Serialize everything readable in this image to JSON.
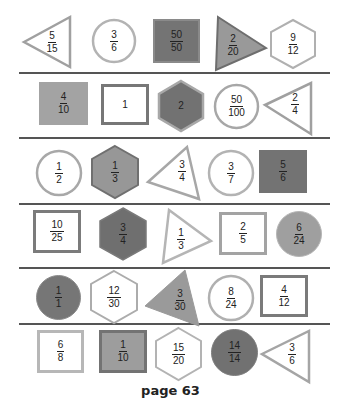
{
  "colors": {
    "outline_light": "#b0b0b0",
    "outline_mid": "#8a8a8a",
    "outline_dark": "#6e6e6e",
    "fill_light": "#a9a9a9",
    "fill_mid": "#949494",
    "fill_dark": "#747474",
    "separator": "#555555"
  },
  "rows": [
    {
      "shapes": [
        {
          "type": "triangle-left",
          "style": "outline",
          "numerator": "5",
          "denominator": "15"
        },
        {
          "type": "circle",
          "style": "outline",
          "numerator": "3",
          "denominator": "6"
        },
        {
          "type": "square",
          "style": "dark",
          "numerator": "50",
          "denominator": "50"
        },
        {
          "type": "triangle-right",
          "style": "fill",
          "numerator": "2",
          "denominator": "20"
        },
        {
          "type": "hexagon",
          "style": "outline",
          "numerator": "9",
          "denominator": "12"
        }
      ]
    },
    {
      "shapes": [
        {
          "type": "square",
          "style": "fill",
          "numerator": "4",
          "denominator": "10"
        },
        {
          "type": "square",
          "style": "outline-dark",
          "whole": "1"
        },
        {
          "type": "hexagon",
          "style": "dark",
          "whole": "2"
        },
        {
          "type": "circle",
          "style": "outline",
          "numerator": "50",
          "denominator": "100"
        },
        {
          "type": "triangle-left",
          "style": "outline",
          "numerator": "2",
          "denominator": "4"
        }
      ]
    },
    {
      "shapes": [
        {
          "type": "circle",
          "style": "outline",
          "numerator": "1",
          "denominator": "2"
        },
        {
          "type": "hexagon",
          "style": "fill",
          "numerator": "1",
          "denominator": "3"
        },
        {
          "type": "triangle-left",
          "style": "outline",
          "numerator": "3",
          "denominator": "4"
        },
        {
          "type": "circle",
          "style": "outline",
          "numerator": "3",
          "denominator": "7"
        },
        {
          "type": "square",
          "style": "dark",
          "numerator": "5",
          "denominator": "6"
        }
      ]
    },
    {
      "shapes": [
        {
          "type": "square",
          "style": "outline-dark",
          "numerator": "10",
          "denominator": "25"
        },
        {
          "type": "hexagon",
          "style": "dark",
          "numerator": "3",
          "denominator": "4"
        },
        {
          "type": "triangle-right",
          "style": "outline",
          "numerator": "1",
          "denominator": "3"
        },
        {
          "type": "square",
          "style": "outline",
          "numerator": "2",
          "denominator": "5"
        },
        {
          "type": "circle",
          "style": "fill",
          "numerator": "6",
          "denominator": "24"
        }
      ]
    },
    {
      "shapes": [
        {
          "type": "circle",
          "style": "dark",
          "numerator": "1",
          "denominator": "1"
        },
        {
          "type": "hexagon",
          "style": "outline",
          "numerator": "12",
          "denominator": "30"
        },
        {
          "type": "triangle-left",
          "style": "fill",
          "numerator": "3",
          "denominator": "30"
        },
        {
          "type": "circle",
          "style": "outline",
          "numerator": "8",
          "denominator": "24"
        },
        {
          "type": "square",
          "style": "outline-dark",
          "numerator": "4",
          "denominator": "12"
        }
      ]
    },
    {
      "shapes": [
        {
          "type": "square",
          "style": "outline",
          "numerator": "6",
          "denominator": "8"
        },
        {
          "type": "square",
          "style": "fill",
          "numerator": "1",
          "denominator": "10"
        },
        {
          "type": "hexagon",
          "style": "outline",
          "numerator": "15",
          "denominator": "20"
        },
        {
          "type": "circle",
          "style": "dark",
          "numerator": "14",
          "denominator": "14"
        },
        {
          "type": "triangle-left",
          "style": "outline",
          "numerator": "3",
          "denominator": "6"
        }
      ]
    }
  ],
  "footer": {
    "page_label": "page 63"
  }
}
